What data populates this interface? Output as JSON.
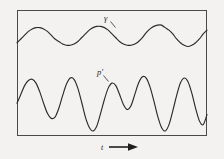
{
  "figure": {
    "background_color": "#f3f2f0",
    "stroke_color": "#2b2b2b",
    "frame_color": "#4a4a4a",
    "width": 224,
    "height": 159
  },
  "frame": {
    "left": 17,
    "top": 10,
    "right": 207,
    "bottom": 136
  },
  "labels": {
    "upper_curve": "γ",
    "lower_curve": "p′",
    "axis": "t",
    "arrow_icon": "right-arrow-icon"
  },
  "chart_data": {
    "type": "line",
    "title": "",
    "xlabel": "t",
    "ylabel": "",
    "grid": false,
    "legend": "none",
    "xlim": [
      0,
      100
    ],
    "ylim": [
      0,
      100
    ],
    "annotations": [
      {
        "text": "γ",
        "x": 47,
        "y": 86,
        "target_x": 50,
        "target_y": 80
      },
      {
        "text": "p′",
        "x": 44,
        "y": 52,
        "target_x": 48,
        "target_y": 45
      },
      {
        "text": "t",
        "x": 45,
        "y": -9
      }
    ],
    "series": [
      {
        "name": "γ",
        "description": "smooth low-amplitude quasi-sinusoidal trace, about five cycles",
        "x": [
          0,
          2,
          4,
          6,
          8,
          10,
          12,
          14,
          16,
          18,
          20,
          22,
          24,
          26,
          28,
          30,
          32,
          34,
          36,
          38,
          40,
          42,
          44,
          46,
          48,
          50,
          52,
          54,
          56,
          58,
          60,
          62,
          64,
          66,
          68,
          70,
          72,
          74,
          76,
          78,
          80,
          82,
          84,
          86,
          88,
          90,
          92,
          94,
          96,
          98,
          100
        ],
        "values": [
          74,
          77,
          80,
          83,
          85,
          86,
          86,
          85,
          83,
          80,
          77,
          75,
          73,
          72,
          72,
          73,
          75,
          78,
          81,
          84,
          86,
          87,
          87,
          86,
          84,
          81,
          78,
          75,
          73,
          72,
          72,
          73,
          75,
          78,
          82,
          85,
          87,
          88,
          88,
          86,
          84,
          81,
          77,
          74,
          72,
          71,
          72,
          74,
          77,
          81,
          84
        ]
      },
      {
        "name": "p′",
        "description": "large-amplitude irregular oscillation with roughly eight cycles of varying height",
        "x": [
          0,
          2,
          4,
          6,
          8,
          10,
          12,
          14,
          16,
          18,
          20,
          22,
          24,
          26,
          28,
          30,
          32,
          34,
          36,
          38,
          40,
          42,
          44,
          46,
          48,
          50,
          52,
          54,
          56,
          58,
          60,
          62,
          64,
          66,
          68,
          70,
          72,
          74,
          76,
          78,
          80,
          82,
          84,
          86,
          88,
          90,
          92,
          94,
          96,
          98,
          100
        ],
        "values": [
          26,
          33,
          40,
          44,
          45,
          42,
          35,
          26,
          18,
          14,
          15,
          22,
          32,
          41,
          46,
          45,
          38,
          27,
          15,
          7,
          4,
          8,
          18,
          29,
          38,
          42,
          40,
          33,
          25,
          21,
          24,
          33,
          42,
          47,
          46,
          39,
          28,
          16,
          7,
          4,
          9,
          20,
          32,
          42,
          46,
          43,
          34,
          22,
          12,
          9,
          17
        ]
      }
    ]
  }
}
